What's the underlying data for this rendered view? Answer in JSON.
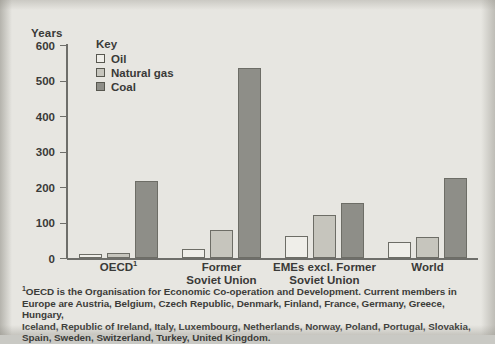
{
  "chart_data": {
    "type": "bar",
    "title": "",
    "xlabel": "",
    "ylabel": "Years",
    "ylim": [
      0,
      600
    ],
    "ytick_labels": [
      "600",
      "500",
      "400",
      "300",
      "200",
      "100",
      "0"
    ],
    "ytick_values": [
      600,
      500,
      400,
      300,
      200,
      100,
      0
    ],
    "grid": false,
    "legend_position": "top-left",
    "legend_title": "Key",
    "categories": [
      "OECD¹",
      "Former Soviet Union",
      "EMEs excl. Former Soviet Union",
      "World"
    ],
    "category_lines": [
      [
        "OECD",
        "1"
      ],
      [
        "Former",
        "Soviet Union"
      ],
      [
        "EMEs excl. Former",
        "Soviet Union"
      ],
      [
        "World"
      ]
    ],
    "series": [
      {
        "name": "Oil",
        "color": "#efeee9",
        "values": [
          10,
          25,
          62,
          45
        ]
      },
      {
        "name": "Natural gas",
        "color": "#c6c5bd",
        "values": [
          15,
          80,
          122,
          60
        ]
      },
      {
        "name": "Coal",
        "color": "#8e8e88",
        "values": [
          218,
          535,
          155,
          225
        ]
      }
    ]
  },
  "footnote": {
    "marker": "1",
    "lines": [
      "OECD is the Organisation for Economic Co-operation and Development. Current members in",
      "Europe are Austria, Belgium, Czech Republic, Denmark, Finland, France, Germany, Greece, Hungary,",
      "Iceland, Republic of Ireland, Italy, Luxembourg, Netherlands, Norway, Poland, Portugal, Slovakia,",
      "Spain, Sweden, Switzerland, Turkey, United Kingdom."
    ]
  }
}
